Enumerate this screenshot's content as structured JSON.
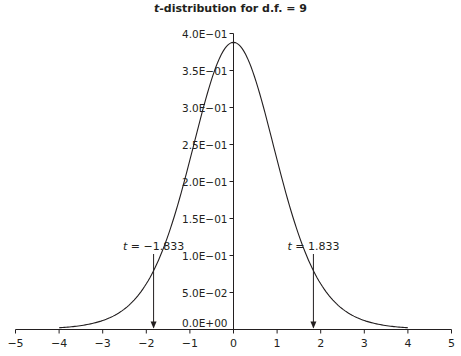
{
  "chart_data": {
    "type": "line",
    "title_italic": "t",
    "title_rest": "-distribution for d.f. = 9",
    "title": "t-distribution for d.f. = 9",
    "xlabel": "",
    "ylabel": "",
    "degrees_of_freedom": 9,
    "xlim": [
      -5,
      5
    ],
    "ylim": [
      0,
      0.4
    ],
    "x_ticks": [
      -5,
      -4,
      -3,
      -2,
      -1,
      0,
      1,
      2,
      3,
      4,
      5
    ],
    "x_tick_labels": [
      "−5",
      "−4",
      "−3",
      "−2",
      "−1",
      "0",
      "1",
      "2",
      "3",
      "4",
      "5"
    ],
    "y_ticks": [
      0,
      0.05,
      0.1,
      0.15,
      0.2,
      0.25,
      0.3,
      0.35,
      0.4
    ],
    "y_tick_labels": [
      "0.0E+00",
      "5.0E−02",
      "1.0E−01",
      "1.5E−01",
      "2.0E−01",
      "2.5E−01",
      "3.0E−01",
      "3.5E−01",
      "4.0E−01"
    ],
    "grid": false,
    "curve_x_range": [
      -4,
      4
    ],
    "series": [
      {
        "name": "t pdf (df=9)",
        "x": [
          -4,
          -3.5,
          -3,
          -2.5,
          -2,
          -1.5,
          -1,
          -0.5,
          0,
          0.5,
          1,
          1.5,
          2,
          2.5,
          3,
          3.5,
          4
        ],
        "values": [
          0.0035,
          0.0072,
          0.015,
          0.031,
          0.0611,
          0.1134,
          0.1947,
          0.3057,
          0.388,
          0.3057,
          0.1947,
          0.1134,
          0.0611,
          0.031,
          0.015,
          0.0072,
          0.0035
        ]
      }
    ],
    "annotations": [
      {
        "text_italic": "t",
        "text_rest": " = −1.833",
        "x": -1.833,
        "arrow_from_y": 0.08,
        "arrow_to_y": 0
      },
      {
        "text_italic": "t",
        "text_rest": " = 1.833",
        "x": 1.833,
        "arrow_from_y": 0.08,
        "arrow_to_y": 0
      }
    ]
  }
}
